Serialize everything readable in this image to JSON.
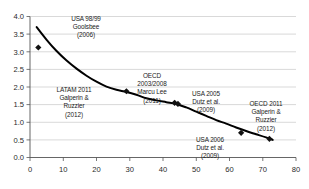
{
  "chart_data": {
    "type": "scatter",
    "title": "",
    "xlabel": "",
    "ylabel": "",
    "xlim": [
      0,
      80
    ],
    "ylim": [
      0,
      4.0
    ],
    "xticks": [
      0,
      10,
      20,
      30,
      40,
      50,
      60,
      70,
      80
    ],
    "xtick_labels": [
      "0",
      "10",
      "20",
      "30",
      "40",
      "50",
      "60",
      "70",
      "80"
    ],
    "yticks": [
      0.0,
      0.5,
      1.0,
      1.5,
      2.0,
      2.5,
      3.0,
      3.5,
      4.0
    ],
    "ytick_labels": [
      "0.0",
      "0.5",
      "1.0",
      "1.5",
      "2.0",
      "2.5",
      "3.0",
      "3.5",
      "4.0"
    ],
    "grid": "horizontal",
    "legend": "none",
    "marker_color": "#111111",
    "line_color": "#000000",
    "axis_color": "#555555",
    "grid_color": "#c8c8c8",
    "points": [
      {
        "x": 2.5,
        "y": 3.12,
        "label": "USA 98/99 Goolsbee (2006)"
      },
      {
        "x": 29.0,
        "y": 1.88,
        "label": "LATAM 2011 Galperin & Ruzzier (2012)"
      },
      {
        "x": 43.5,
        "y": 1.55,
        "label": "OECD 2003/2008 Marcu Lee (2011)"
      },
      {
        "x": 44.5,
        "y": 1.52,
        "label": "USA 2005 Dutz et al. (2009)"
      },
      {
        "x": 63.5,
        "y": 0.7,
        "label": "USA 2006 Dutz et al. (2009)"
      },
      {
        "x": 72.0,
        "y": 0.53,
        "label": "OECD 2011 Galperin & Ruzzier (2012)"
      }
    ],
    "fit_curve": {
      "name": "fitted trend",
      "x": [
        2,
        5,
        8,
        11,
        14,
        17,
        20,
        23,
        26,
        29,
        32,
        35,
        38,
        41,
        44,
        47,
        50,
        53,
        56,
        59,
        62,
        65,
        68,
        71,
        73
      ],
      "y": [
        3.7,
        3.34,
        3.02,
        2.75,
        2.52,
        2.32,
        2.15,
        2.01,
        1.92,
        1.86,
        1.78,
        1.68,
        1.62,
        1.57,
        1.52,
        1.42,
        1.3,
        1.18,
        1.06,
        0.96,
        0.85,
        0.75,
        0.66,
        0.57,
        0.5
      ]
    },
    "annotations": [
      {
        "id": "ann-usa-9899",
        "lines": [
          "USA 98/99",
          "Goolsbee",
          "(2006)"
        ]
      },
      {
        "id": "ann-latam-2011",
        "lines": [
          "LATAM 2011",
          "Galperin &",
          "Ruzzier",
          "(2012)"
        ]
      },
      {
        "id": "ann-oecd-2003-2008",
        "lines": [
          "OECD",
          "2003/2008",
          "Marcu Lee",
          "(2011)"
        ]
      },
      {
        "id": "ann-usa-2005",
        "lines": [
          "USA 2005",
          "Dutz et al.",
          "(2009)"
        ]
      },
      {
        "id": "ann-oecd-2011",
        "lines": [
          "OECD 2011",
          "Galperin &",
          "Ruzzier",
          "(2012)"
        ]
      },
      {
        "id": "ann-usa-2006",
        "lines": [
          "USA 2006",
          "Dutz et al.",
          "(2009)"
        ]
      }
    ]
  }
}
